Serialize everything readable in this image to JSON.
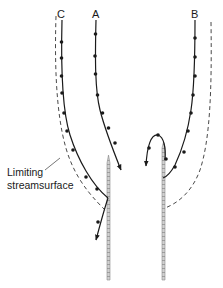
{
  "diagram": {
    "type": "flow-streamlines",
    "labels": {
      "streamline_c": "C",
      "streamline_a": "A",
      "streamline_b": "B",
      "limiting_line1": "Limiting",
      "limiting_line2": "streamsurface"
    },
    "colors": {
      "line": "#1a1a1a",
      "plate_fill": "#c8c8c8",
      "plate_edge": "#8a8a8a",
      "background": "#ffffff"
    },
    "elements": [
      {
        "name": "streamline-c",
        "label": "C",
        "markers": true,
        "arrow": true
      },
      {
        "name": "streamline-a",
        "label": "A",
        "markers": true,
        "arrow": true
      },
      {
        "name": "streamline-b",
        "label": "B",
        "markers": true,
        "arrow": true,
        "loop": true
      },
      {
        "name": "limiting-streamsurface-left",
        "style": "dashed"
      },
      {
        "name": "limiting-streamsurface-right",
        "style": "dashed"
      },
      {
        "name": "plate-left",
        "style": "hatched"
      },
      {
        "name": "plate-right",
        "style": "hatched"
      }
    ]
  }
}
